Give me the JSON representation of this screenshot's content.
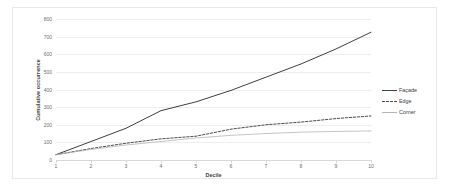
{
  "chart_data": {
    "type": "line",
    "title": "",
    "xlabel": "Decile",
    "ylabel": "Cumulative occurrence",
    "categories": [
      "1",
      "2",
      "3",
      "4",
      "5",
      "6",
      "7",
      "8",
      "9",
      "10"
    ],
    "x": [
      1,
      2,
      3,
      4,
      5,
      6,
      7,
      8,
      9,
      10
    ],
    "xlim": [
      1,
      10
    ],
    "ylim": [
      0,
      800
    ],
    "yticks": [
      0,
      100,
      200,
      300,
      400,
      500,
      600,
      700,
      800
    ],
    "xticks": [
      "1",
      "2",
      "3",
      "4",
      "5",
      "6",
      "7",
      "8",
      "9",
      "10"
    ],
    "grid": "horizontal",
    "legend_position": "right",
    "series": [
      {
        "name": "Façade",
        "style": "solid",
        "color": "#3f3f3f",
        "width": 1,
        "values": [
          30,
          105,
          180,
          280,
          330,
          395,
          470,
          545,
          630,
          725
        ]
      },
      {
        "name": "Edge",
        "style": "dashed",
        "color": "#4d4d4d",
        "width": 1,
        "values": [
          30,
          65,
          95,
          120,
          135,
          175,
          200,
          215,
          235,
          250
        ]
      },
      {
        "name": "Corner",
        "style": "solid",
        "color": "#b5b5b5",
        "width": 0.8,
        "values": [
          30,
          60,
          85,
          105,
          125,
          140,
          150,
          158,
          162,
          165
        ]
      }
    ]
  },
  "legend": {
    "items": [
      {
        "label": "Façade"
      },
      {
        "label": "Edge"
      },
      {
        "label": "Corner"
      }
    ]
  },
  "axes": {
    "y_title": "Cumulative occurrence",
    "x_title": "Decile"
  },
  "colors": {
    "facade": "#3f3f3f",
    "edge": "#4d4d4d",
    "corner": "#b5b5b5",
    "grid": "#ededed",
    "frame": "#e8e8e8",
    "tick_text": "#6e6e6e",
    "axis_title": "#3f3f3f"
  }
}
